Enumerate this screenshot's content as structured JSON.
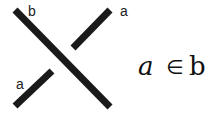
{
  "diagram": {
    "type": "knot-crossing",
    "strands": [
      {
        "name": "b",
        "role": "over-strand",
        "from": [
          15,
          10
        ],
        "to": [
          110,
          107
        ]
      },
      {
        "name": "a",
        "role": "under-strand",
        "segments": [
          [
            [
              15,
              106
            ],
            [
              52,
              71
            ]
          ],
          [
            [
              73,
              48
            ],
            [
              110,
              10
            ]
          ]
        ]
      }
    ],
    "labels": {
      "b_top": "b",
      "a_top": "a",
      "a_bottom": "a"
    },
    "formula": {
      "left": "a",
      "symbol": "∈",
      "right": "b"
    },
    "colors": {
      "stroke": "#1a1a1a",
      "background": "#ffffff"
    }
  }
}
